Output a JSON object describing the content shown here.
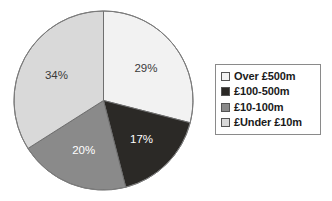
{
  "chart_data": {
    "type": "pie",
    "title": "",
    "labels": [
      "Over £500m",
      "£100-500m",
      "£10-100m",
      "£Under £10m"
    ],
    "values": [
      29,
      17,
      20,
      34
    ],
    "value_labels": [
      "29%",
      "17%",
      "20%",
      "34%"
    ],
    "colors": [
      "#f2f2f2",
      "#2b2926",
      "#8a8a8a",
      "#d9d9d9"
    ],
    "label_text_colors": [
      "#3a3a3a",
      "#ffffff",
      "#ffffff",
      "#3a3a3a"
    ],
    "start_angle_deg": 0,
    "direction": "clockwise",
    "legend_position": "right",
    "grid": false,
    "units": "percent"
  },
  "legend": {
    "items": [
      {
        "label": "Over £500m",
        "color": "#f2f2f2"
      },
      {
        "label": "£100-500m",
        "color": "#2b2926"
      },
      {
        "label": "£10-100m",
        "color": "#8a8a8a"
      },
      {
        "label": "£Under £10m",
        "color": "#d9d9d9"
      }
    ]
  },
  "pie": {
    "slices": [
      {
        "name": "over-500m",
        "percent_label": "29%"
      },
      {
        "name": "100-500m",
        "percent_label": "17%"
      },
      {
        "name": "10-100m",
        "percent_label": "20%"
      },
      {
        "name": "under-10m",
        "percent_label": "34%"
      }
    ]
  }
}
